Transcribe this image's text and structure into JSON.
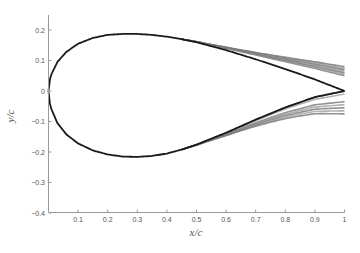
{
  "chart_data": {
    "type": "line",
    "title": "",
    "xlabel": "x/c",
    "ylabel": "y/c",
    "xlim": [
      0,
      1
    ],
    "ylim": [
      -0.42,
      0.25
    ],
    "grid": false,
    "legend": null,
    "x_ticks": [
      "0.1",
      "0.2",
      "0.3",
      "0.4",
      "0.5",
      "0.6",
      "0.7",
      "0.8",
      "0.9",
      "1"
    ],
    "y_ticks": [
      "0.2",
      "0.1",
      "0",
      "-0.1",
      "-0.2",
      "-0.3",
      "-0.4"
    ],
    "series": [
      {
        "name": "baseline upper surface",
        "color": "#1a1a1a",
        "x": [
          0,
          0.01,
          0.03,
          0.06,
          0.1,
          0.15,
          0.2,
          0.25,
          0.3,
          0.35,
          0.4,
          0.45,
          0.5,
          0.6,
          0.7,
          0.8,
          0.9,
          1.0
        ],
        "y": [
          0,
          0.055,
          0.095,
          0.128,
          0.155,
          0.174,
          0.184,
          0.187,
          0.187,
          0.184,
          0.178,
          0.17,
          0.16,
          0.134,
          0.104,
          0.072,
          0.038,
          0.0
        ]
      },
      {
        "name": "baseline lower surface",
        "color": "#1a1a1a",
        "x": [
          0,
          0.01,
          0.03,
          0.06,
          0.1,
          0.15,
          0.2,
          0.25,
          0.3,
          0.35,
          0.4,
          0.45,
          0.5,
          0.6,
          0.7,
          0.8,
          0.9,
          1.0
        ],
        "y": [
          0,
          -0.06,
          -0.105,
          -0.142,
          -0.172,
          -0.195,
          -0.208,
          -0.215,
          -0.216,
          -0.213,
          -0.205,
          -0.192,
          -0.176,
          -0.137,
          -0.094,
          -0.054,
          -0.02,
          0.0
        ]
      },
      {
        "name": "upper trailing-edge variants (range at x/c=1)",
        "color": "#7a7a7a",
        "x_start": 0.45,
        "y_at_x1": [
          0.05,
          0.055,
          0.06,
          0.065,
          0.07,
          0.075,
          0.08
        ]
      },
      {
        "name": "lower trailing-edge variants (range at x/c=1)",
        "color": "#7a7a7a",
        "x_start": 0.45,
        "y_at_x1": [
          0.0,
          -0.01,
          -0.035,
          -0.045,
          -0.055,
          -0.065,
          -0.075
        ]
      }
    ]
  }
}
